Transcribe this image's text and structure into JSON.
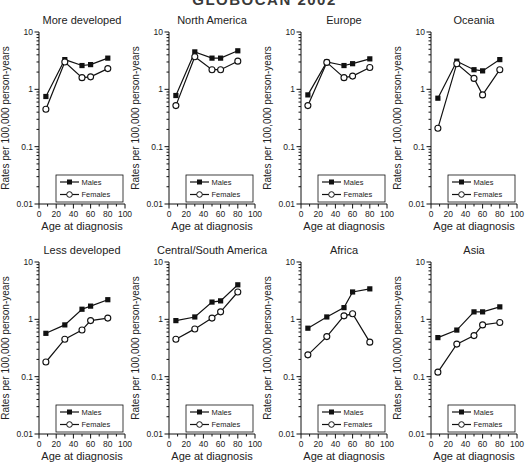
{
  "figure_title": "GLOBOCAN 2002",
  "axes": {
    "ylabel": "Rates per 100,000 person-years",
    "xlabel": "Age at diagnosis",
    "yscale": "log",
    "ylim": [
      0.01,
      10
    ],
    "xlim": [
      0,
      100
    ],
    "y_tick_labels": [
      "10",
      "1",
      "0.1",
      "0.01"
    ],
    "y_tick_values": [
      10,
      1,
      0.1,
      0.01
    ],
    "x_tick_labels": [
      "0",
      "20",
      "40",
      "60",
      "80",
      "100"
    ],
    "x_tick_values": [
      0,
      20,
      40,
      60,
      80,
      100
    ],
    "x_minor_tick_values": [
      10,
      30,
      50,
      70,
      90
    ],
    "grid": "off"
  },
  "legend": {
    "position": "bottom-center-inside",
    "entries": [
      {
        "label": "Males",
        "marker": "filled-square"
      },
      {
        "label": "Females",
        "marker": "open-circle"
      }
    ]
  },
  "chart_data": [
    {
      "type": "line",
      "title": "More developed",
      "xlabel": "Age at diagnosis",
      "ylabel": "Rates per 100,000 person-years",
      "x": [
        8,
        30,
        50,
        60,
        80
      ],
      "series": [
        {
          "name": "Males",
          "marker": "filled-square",
          "values": [
            0.75,
            3.3,
            2.6,
            2.7,
            3.5
          ]
        },
        {
          "name": "Females",
          "marker": "open-circle",
          "values": [
            0.45,
            3.0,
            1.6,
            1.65,
            2.3
          ]
        }
      ]
    },
    {
      "type": "line",
      "title": "North America",
      "xlabel": "Age at diagnosis",
      "ylabel": "Rates per 100,000 person-years",
      "x": [
        8,
        30,
        50,
        60,
        80
      ],
      "series": [
        {
          "name": "Males",
          "marker": "filled-square",
          "values": [
            0.78,
            4.5,
            3.5,
            3.5,
            4.7
          ]
        },
        {
          "name": "Females",
          "marker": "open-circle",
          "values": [
            0.52,
            3.7,
            2.2,
            2.2,
            3.1
          ]
        }
      ]
    },
    {
      "type": "line",
      "title": "Europe",
      "xlabel": "Age at diagnosis",
      "ylabel": "Rates per 100,000 person-years",
      "x": [
        8,
        30,
        50,
        60,
        80
      ],
      "series": [
        {
          "name": "Males",
          "marker": "filled-square",
          "values": [
            0.8,
            3.0,
            2.6,
            2.8,
            3.4
          ]
        },
        {
          "name": "Females",
          "marker": "open-circle",
          "values": [
            0.52,
            2.95,
            1.6,
            1.7,
            2.4
          ]
        }
      ]
    },
    {
      "type": "line",
      "title": "Oceania",
      "xlabel": "Age at diagnosis",
      "ylabel": "Rates per 100,000 person-years",
      "x": [
        8,
        30,
        50,
        60,
        80
      ],
      "series": [
        {
          "name": "Males",
          "marker": "filled-square",
          "values": [
            0.7,
            3.1,
            2.2,
            2.1,
            3.3
          ]
        },
        {
          "name": "Females",
          "marker": "open-circle",
          "values": [
            0.21,
            2.8,
            1.55,
            0.8,
            2.2
          ]
        }
      ]
    },
    {
      "type": "line",
      "title": "Less developed",
      "xlabel": "Age at diagnosis",
      "ylabel": "Rates per 100,000 person-years",
      "x": [
        8,
        30,
        50,
        60,
        80
      ],
      "series": [
        {
          "name": "Males",
          "marker": "filled-square",
          "values": [
            0.57,
            0.8,
            1.5,
            1.7,
            2.2
          ]
        },
        {
          "name": "Females",
          "marker": "open-circle",
          "values": [
            0.18,
            0.45,
            0.65,
            0.95,
            1.05
          ]
        }
      ]
    },
    {
      "type": "line",
      "title": "Central/South America",
      "xlabel": "Age at diagnosis",
      "ylabel": "Rates per 100,000 person-years",
      "x": [
        8,
        30,
        50,
        60,
        80
      ],
      "series": [
        {
          "name": "Males",
          "marker": "filled-square",
          "values": [
            0.95,
            1.1,
            2.0,
            2.1,
            4.0
          ]
        },
        {
          "name": "Females",
          "marker": "open-circle",
          "values": [
            0.45,
            0.68,
            1.05,
            1.35,
            3.0
          ]
        }
      ]
    },
    {
      "type": "line",
      "title": "Africa",
      "xlabel": "Age at diagnosis",
      "ylabel": "Rates per 100,000 person-years",
      "x": [
        8,
        30,
        50,
        60,
        80
      ],
      "series": [
        {
          "name": "Males",
          "marker": "filled-square",
          "values": [
            0.7,
            1.1,
            1.6,
            3.0,
            3.4
          ]
        },
        {
          "name": "Females",
          "marker": "open-circle",
          "values": [
            0.24,
            0.5,
            1.15,
            1.25,
            0.4
          ]
        }
      ]
    },
    {
      "type": "line",
      "title": "Asia",
      "xlabel": "Age at diagnosis",
      "ylabel": "Rates per 100,000 person-years",
      "x": [
        8,
        30,
        50,
        60,
        80
      ],
      "series": [
        {
          "name": "Males",
          "marker": "filled-square",
          "values": [
            0.48,
            0.65,
            1.35,
            1.35,
            1.65
          ]
        },
        {
          "name": "Females",
          "marker": "open-circle",
          "values": [
            0.12,
            0.37,
            0.52,
            0.8,
            0.88
          ]
        }
      ]
    }
  ]
}
